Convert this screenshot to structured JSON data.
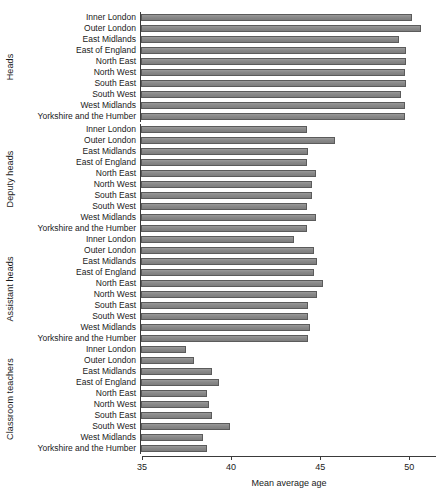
{
  "chart_data": {
    "type": "bar",
    "orientation": "horizontal",
    "title": "",
    "xlabel": "Mean average age",
    "ylabel": "",
    "xlim": [
      35,
      51.5
    ],
    "xticks": [
      35,
      40,
      45,
      50
    ],
    "grid": false,
    "legend": null,
    "bar_color": "#8a8a8a",
    "bar_edge_color": "#5b5b5b",
    "categories": [
      "Inner London",
      "Outer London",
      "East Midlands",
      "East of England",
      "North East",
      "North West",
      "South East",
      "South West",
      "West Midlands",
      "Yorkshire and the Humber"
    ],
    "facets": [
      {
        "name": "Heads",
        "values": [
          50.2,
          50.7,
          49.5,
          49.9,
          49.9,
          49.8,
          49.9,
          49.6,
          49.8,
          49.8
        ]
      },
      {
        "name": "Deputy heads",
        "values": [
          44.3,
          45.9,
          44.4,
          44.3,
          44.8,
          44.6,
          44.6,
          44.3,
          44.8,
          44.3
        ]
      },
      {
        "name": "Assistant heads",
        "values": [
          43.6,
          44.7,
          44.9,
          44.7,
          45.2,
          44.9,
          44.4,
          44.4,
          44.5,
          44.4
        ]
      },
      {
        "name": "Classroom teachers",
        "values": [
          37.5,
          38.0,
          39.0,
          39.4,
          38.7,
          38.8,
          39.0,
          40.0,
          38.5,
          38.7
        ]
      }
    ]
  }
}
